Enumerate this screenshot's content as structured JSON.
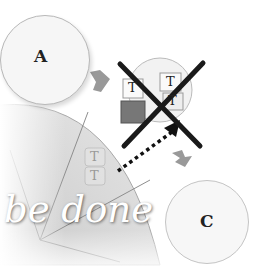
{
  "diagram": {
    "nodes": [
      {
        "id": "A",
        "label": "A"
      },
      {
        "id": "B",
        "label": "",
        "crossed_out": true,
        "tiles": [
          "T",
          "T",
          "T",
          ""
        ]
      },
      {
        "id": "C",
        "label": "C"
      }
    ],
    "sector": {
      "tiles": [
        "T",
        "T"
      ],
      "overlay_text": "be done"
    },
    "arrows": [
      {
        "from": "A",
        "to": "B",
        "style": "block-gray"
      },
      {
        "from": "B",
        "to": "C",
        "style": "block-gray"
      },
      {
        "from": "sector",
        "to": "B",
        "style": "dotted-black"
      }
    ],
    "colors": {
      "sector_fill": "#d9d9d9",
      "cross": "#1a1a1a",
      "arrow": "#9a9a9a"
    }
  }
}
